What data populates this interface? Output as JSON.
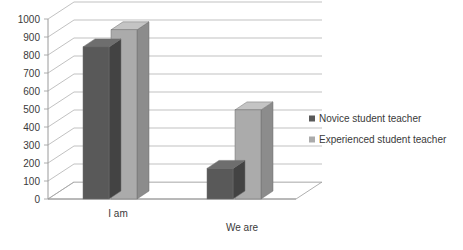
{
  "chart_data": {
    "type": "bar",
    "title": "",
    "subtitle": "",
    "xlabel": "",
    "ylabel": "",
    "categories": [
      "I am",
      "We are"
    ],
    "series": [
      {
        "name": "Novice student teacher",
        "color": "#595959",
        "values": [
          845,
          170
        ]
      },
      {
        "name": "Experienced student teacher",
        "color": "#ABABAB",
        "values": [
          940,
          495
        ]
      }
    ],
    "ylim": [
      0,
      1000
    ],
    "ytick_step": 100,
    "yticks": [
      "0",
      "100",
      "200",
      "300",
      "400",
      "500",
      "600",
      "700",
      "800",
      "900",
      "1000"
    ],
    "grid": true,
    "legend_position": "right",
    "style": "3d-column"
  },
  "legend": {
    "items": [
      {
        "label": "Novice student teacher",
        "swatch": "#595959"
      },
      {
        "label": "Experienced student teacher",
        "swatch": "#ABABAB"
      }
    ]
  },
  "colors": {
    "series_dark": "#595959",
    "series_light": "#ABABAB",
    "series_dark_side": "#434343",
    "series_light_side": "#8C8C8C",
    "series_dark_top": "#6E6E6E",
    "series_light_top": "#C4C4C4",
    "gridline": "#A6A6A6",
    "axis": "#9A9A9A",
    "text": "#3a3a3a",
    "background": "#ffffff"
  }
}
